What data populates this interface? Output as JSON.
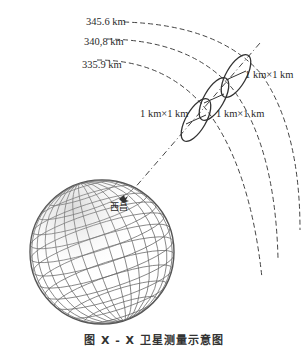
{
  "orbits": [
    {
      "label": "345.6 km"
    },
    {
      "label": "340,8 km"
    },
    {
      "label": "335.9 km"
    }
  ],
  "ellipses": [
    {
      "label": "1 km×1 km"
    },
    {
      "label": "1 km×1 km"
    },
    {
      "label": "1 km×1 km"
    }
  ],
  "station": {
    "label": "西昌"
  },
  "caption": "图 X - X  卫星测量示意图",
  "colors": {
    "line": "#333333",
    "globe": "#555555",
    "background": "#ffffff"
  }
}
